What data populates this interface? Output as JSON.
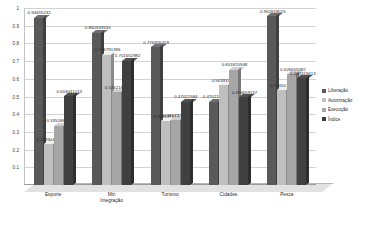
{
  "chart_data": {
    "type": "bar",
    "title": "",
    "xlabel": "",
    "ylabel": "",
    "ylim": [
      0,
      1
    ],
    "grid": true,
    "legend_position": "right",
    "categories": [
      "Esporte",
      "Min\nIntegração",
      "Turismo",
      "Cidades",
      "Pesca"
    ],
    "y_ticks": [
      "1",
      "0.9",
      "0.8",
      "0.7",
      "0.6",
      "0.5",
      "0.4",
      "0.3",
      "0.2",
      "0.1"
    ],
    "series": [
      {
        "name": "Liberação",
        "color": "#595959",
        "values": [
          0.94455232,
          0.860949533,
          0.776926409,
          0.47021584,
          0.952818025
        ],
        "labels": [
          "0.94455232",
          "0.860949533",
          "0.776926409",
          "0.47021584",
          "0.952818025"
        ]
      },
      {
        "name": "Autorização",
        "color": "#bfbfbf",
        "values": [
          0.229304125,
          0.736791396,
          0.358997164,
          0.563933572,
          0.534507896
        ],
        "labels": [
          "0.229304125",
          "0.736791396",
          "0.358997164",
          "0.563933572",
          "0.534507896"
        ]
      },
      {
        "name": "Execução",
        "color": "#a6a6a6",
        "values": [
          0.335186997,
          0.525216213,
          0.366722804,
          0.651820948,
          0.626655382
        ],
        "labels": [
          "0.335186997",
          "0.525216213",
          "0.366722804",
          "0.651820948",
          "0.626655382"
        ]
      },
      {
        "name": "Índice",
        "color": "#404040",
        "values": [
          0.503041013,
          0.701652982,
          0.47021584,
          0.494659157,
          0.604318413
        ],
        "labels": [
          "0.503041013",
          "0.701652982",
          "0.47021584",
          "0.494659157",
          "0.604318413"
        ]
      }
    ]
  }
}
